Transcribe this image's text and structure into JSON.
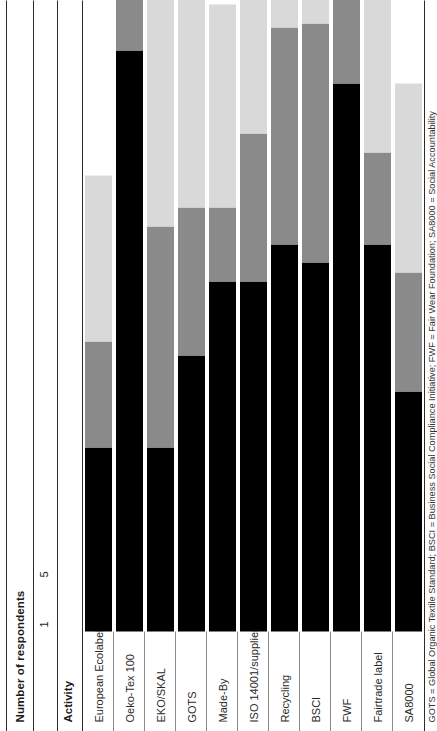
{
  "figure": {
    "orientation": "rotated-90-ccw",
    "axis_title": "Number of respondents",
    "category_header": "Activity",
    "tick_labels": [
      "1",
      "5"
    ],
    "footnote": "GOTS = Global Organic Textile Standard; BSCI = Business Social Compliance Initiative; FWF = Fair Wear Foundation; SA8000 = Social Accountability",
    "colors": {
      "series_1": "#000000",
      "series_2": "#8a8a8a",
      "series_3": "#d9d9d9",
      "rule": "#2b2b2b",
      "background": "#ffffff"
    }
  },
  "chart_data": {
    "type": "bar",
    "title": "",
    "subtitle": "",
    "xlabel": "Number of respondents",
    "ylabel": "Activity",
    "orientation": "horizontal",
    "stacked": true,
    "grid": false,
    "legend_position": "none",
    "xlim": [
      0,
      13
    ],
    "xticks": [
      1,
      5
    ],
    "xticklabels": [
      "1",
      "5"
    ],
    "categories": [
      "European Ecolabel",
      "Oeko-Tex 100",
      "EKO/SKAL",
      "GOTS",
      "Made-By",
      "ISO 14001/suppliers",
      "Recycling",
      "BSCI",
      "FWF",
      "Fairtrade label",
      "SA8000"
    ],
    "series": [
      {
        "name": "series_1",
        "color": "#000000",
        "values": [
          4.0,
          12.6,
          4.0,
          6.0,
          7.6,
          7.6,
          8.4,
          8.0,
          11.9,
          8.4,
          5.2
        ]
      },
      {
        "name": "series_2",
        "color": "#8a8a8a",
        "values": [
          2.3,
          7.9,
          4.8,
          3.2,
          1.6,
          3.2,
          4.7,
          5.2,
          3.4,
          2.0,
          2.6
        ]
      },
      {
        "name": "series_3",
        "color": "#d9d9d9",
        "values": [
          3.6,
          8.3,
          6.0,
          4.6,
          4.4,
          4.5,
          7.0,
          6.6,
          4.7,
          4.4,
          4.1
        ]
      }
    ],
    "annotations": [
      "GOTS = Global Organic Textile Standard; BSCI = Business Social Compliance Initiative; FWF = Fair Wear Foundation; SA8000 = Social Accountability"
    ]
  }
}
